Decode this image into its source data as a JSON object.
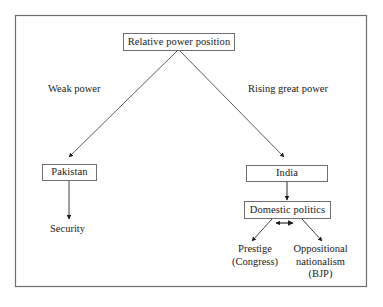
{
  "diagram": {
    "title": "Relative power position",
    "frame": {
      "border_color": "#6e6e70",
      "background": "#ffffff"
    },
    "nodes": {
      "root": {
        "label": "Relative power position"
      },
      "pakistan": {
        "label": "Pakistan"
      },
      "india": {
        "label": "India"
      },
      "domestic_politics": {
        "label": "Domestic politics"
      }
    },
    "edge_labels": {
      "left_branch": "Weak power",
      "right_branch": "Rising great power"
    },
    "leaves": {
      "security": {
        "line1": "Security"
      },
      "prestige": {
        "line1": "Prestige",
        "line2": "(Congress)"
      },
      "opposition": {
        "line1": "Oppositional",
        "line2": "nationalism",
        "line3": "(BJP)"
      }
    },
    "connectors": {
      "root_to_pakistan": "arrow",
      "root_to_india": "arrow",
      "pakistan_to_security": "arrow",
      "india_to_domestic_politics": "arrow",
      "domestic_to_prestige": "arrow",
      "domestic_to_opposition": "arrow",
      "prestige_opposition_link": "double-arrow"
    }
  }
}
